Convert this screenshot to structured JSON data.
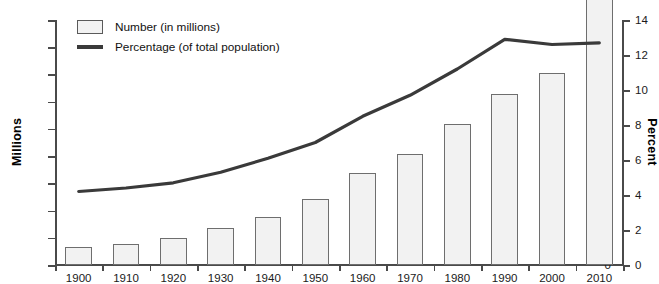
{
  "chart_data": {
    "type": "bar",
    "title": "",
    "subtitle": "",
    "xlabel": "",
    "ylabel": "Millions",
    "y2label": "Percent",
    "categories": [
      "1900",
      "1910",
      "1920",
      "1930",
      "1940",
      "1950",
      "1960",
      "1970",
      "1980",
      "1990",
      "2000",
      "2010"
    ],
    "ylim": [
      0,
      55
    ],
    "y2lim": [
      0,
      14
    ],
    "yticks": [
      "0",
      "5",
      "10",
      "15",
      "20",
      "25",
      "30",
      "35",
      "50",
      "55"
    ],
    "ytick_positions": [
      0,
      5,
      10,
      15,
      20,
      25,
      30,
      35,
      40,
      45
    ],
    "y2ticks": [
      "0",
      "2",
      "4",
      "6",
      "8",
      "10",
      "12",
      "14"
    ],
    "y2tick_positions": [
      0,
      2,
      4,
      6,
      8,
      10,
      12,
      14
    ],
    "grid": false,
    "legend_position": "top-left",
    "series": [
      {
        "name": "Number (in millions)",
        "legend_label": "Number (in millions)",
        "kind": "bar",
        "axis": "left",
        "fill": "#f2f2f2",
        "stroke": "#6e6e6e",
        "values": [
          3.4,
          3.8,
          4.9,
          6.8,
          8.9,
          12.2,
          16.9,
          20.4,
          25.9,
          31.5,
          35.3,
          50.6
        ]
      },
      {
        "name": "Percentage (of total population)",
        "legend_label": "Percentage (of total population)",
        "kind": "line",
        "axis": "right",
        "stroke": "#3a3a3a",
        "values": [
          4.2,
          4.4,
          4.7,
          5.3,
          6.1,
          7.0,
          8.5,
          9.7,
          11.2,
          12.9,
          12.6,
          12.7
        ]
      }
    ]
  },
  "axes": {
    "left_title": "Millions",
    "right_title": "Percent"
  },
  "legend": {
    "items": [
      {
        "label": "Number (in millions)",
        "marker": "box-swatch"
      },
      {
        "label": "Percentage (of total population)",
        "marker": "line-swatch"
      }
    ]
  },
  "colors": {
    "bar_fill": "#f2f2f2",
    "bar_stroke": "#6e6e6e",
    "line": "#3a3a3a",
    "axis": "#4a4a4a",
    "text": "#111111",
    "background": "#ffffff"
  }
}
